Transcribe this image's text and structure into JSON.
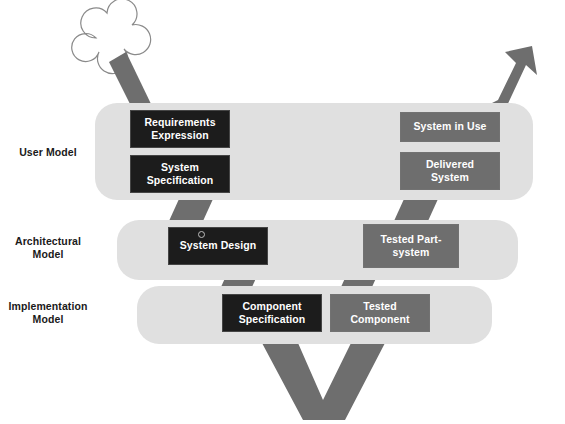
{
  "diagram": {
    "background_color": "#ffffff",
    "band_color": "#e0e0e0",
    "dark_box_color": "#1c1c1c",
    "mid_box_color": "#6e6e6e",
    "arrow_color": "#6e6e6e",
    "cloud_outline_color": "#8a8a8a",
    "text_color": "#1a1a1a",
    "box_text_color": "#ffffff"
  },
  "rows": [
    {
      "label": "User Model"
    },
    {
      "label": "Architectural\nModel"
    },
    {
      "label": "Implementation\nModel"
    }
  ],
  "boxes": {
    "requirements_expression": {
      "label": "Requirements\nExpression",
      "style": "dark"
    },
    "system_specification": {
      "label": "System\nSpecification",
      "style": "dark"
    },
    "system_in_use": {
      "label": "System in Use",
      "style": "mid"
    },
    "delivered_system": {
      "label": "Delivered\nSystem",
      "style": "mid"
    },
    "system_design": {
      "label": "System Design",
      "style": "dark"
    },
    "tested_part_system": {
      "label": "Tested Part-\nsystem",
      "style": "mid"
    },
    "component_specification": {
      "label": "Component\nSpecification",
      "style": "dark"
    },
    "tested_component": {
      "label": "Tested\nComponent",
      "style": "mid"
    }
  },
  "icons": {
    "cloud": "cloud-icon",
    "system_design_dot": "circle-dot-icon",
    "inbound_arrow": "arrow-down-right-icon",
    "outbound_arrow": "arrow-up-right-icon",
    "exit_arrow": "arrow-down-icon",
    "connector": "connector-arrow-icon"
  }
}
